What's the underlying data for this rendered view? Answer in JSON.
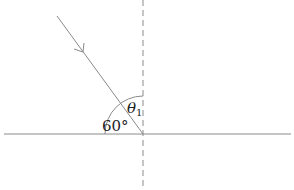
{
  "diagram": {
    "type": "ray-incidence-angle",
    "labels": {
      "angle_to_surface": "60°",
      "theta_symbol": "θ",
      "theta_subscript": "1"
    },
    "elements": {
      "surface": "horizontal line",
      "normal": "vertical dashed line",
      "incident_ray": "arrowed line toward intersection",
      "angle_arc": "quarter arc between surface and normal"
    },
    "colors": {
      "line": "#888888",
      "text": "#222222",
      "background": "#ffffff"
    }
  }
}
